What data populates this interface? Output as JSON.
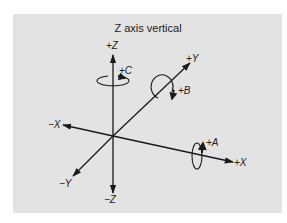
{
  "title": "Z axis vertical",
  "axes": {
    "pos_z": "+Z",
    "neg_z": "−Z",
    "pos_y": "+Y",
    "neg_y": "−Y",
    "pos_x": "+X",
    "neg_x": "−X"
  },
  "rotations": {
    "a": "+A",
    "b": "+B",
    "c": "+C"
  },
  "colors": {
    "background": "#e3e3e3",
    "line": "#1a1a1a"
  }
}
